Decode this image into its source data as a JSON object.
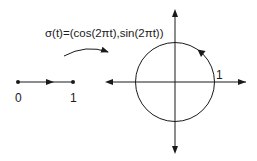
{
  "diagram": {
    "formula": "σ(t)=(cos(2πt),sin(2πt))",
    "interval": {
      "start_label": "0",
      "end_label": "1"
    },
    "circle": {
      "radius_label": "1",
      "direction": "counterclockwise"
    },
    "colors": {
      "stroke": "#1a1a1a",
      "background": "#ffffff"
    }
  }
}
